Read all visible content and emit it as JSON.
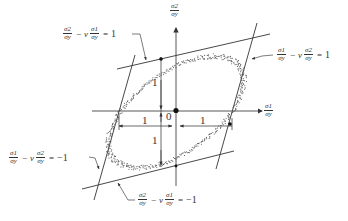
{
  "diagram": {
    "type": "yield-surface",
    "axes": {
      "x_label": {
        "num": "σ1",
        "den": "σy"
      },
      "y_label": {
        "num": "σ2",
        "den": "σy"
      },
      "origin_label": "0"
    },
    "dimension_labels": {
      "top": "1",
      "bottom": "1",
      "left": "1",
      "right": "1"
    },
    "equations": [
      {
        "id": "top",
        "a": {
          "num": "σ2",
          "den": "σy"
        },
        "minus": "−",
        "nu": "ν",
        "b": {
          "num": "σ1",
          "den": "σy"
        },
        "eq": "=",
        "rhs": "1"
      },
      {
        "id": "right",
        "a": {
          "num": "σ1",
          "den": "σy"
        },
        "minus": "−",
        "nu": "ν",
        "b": {
          "num": "σ2",
          "den": "σy"
        },
        "eq": "=",
        "rhs": "1"
      },
      {
        "id": "left",
        "a": {
          "num": "σ1",
          "den": "σy"
        },
        "minus": "−",
        "nu": "ν",
        "b": {
          "num": "σ2",
          "den": "σy"
        },
        "eq": "=",
        "rhs": "−1"
      },
      {
        "id": "bottom",
        "a": {
          "num": "σ2",
          "den": "σy"
        },
        "minus": "−",
        "nu": "ν",
        "b": {
          "num": "σ1",
          "den": "σy"
        },
        "eq": "=",
        "rhs": "−1"
      }
    ],
    "colors": {
      "line": "#333333",
      "points": "#444444",
      "background": "#ffffff"
    }
  }
}
